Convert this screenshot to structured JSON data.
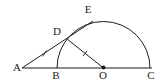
{
  "diagram": {
    "canvas": {
      "width": 164,
      "height": 82,
      "background": "#ffffff",
      "stroke_color": "#1c1c1c",
      "stroke_width": 1
    },
    "circle": {
      "name": "semicircle-arc",
      "cx": 103.5,
      "cy": 68,
      "r": 46.5
    },
    "segments": [
      {
        "name": "baseline-AC",
        "x1": 22,
        "y1": 68,
        "x2": 152,
        "y2": 68
      },
      {
        "name": "secant-ADE",
        "x1": 22,
        "y1": 68,
        "x2": 93,
        "y2": 21
      },
      {
        "name": "segment-DO",
        "x1": 67,
        "y1": 39,
        "x2": 103.5,
        "y2": 68
      }
    ],
    "ticks": [
      {
        "name": "tick-AD",
        "x": 44.5,
        "y": 53.5,
        "angle_deg": 57,
        "len": 7
      },
      {
        "name": "tick-DO",
        "x": 85.0,
        "y": 53.5,
        "angle_deg": 51,
        "len": 7
      }
    ],
    "center_dot": {
      "name": "center-dot-O",
      "x": 103.5,
      "y": 67.5,
      "r": 1.9,
      "fill": "#111111"
    },
    "labels": [
      {
        "name": "label-A",
        "text": "A",
        "x": 17,
        "y": 71,
        "size": 11
      },
      {
        "name": "label-B",
        "text": "B",
        "x": 56,
        "y": 79,
        "size": 11
      },
      {
        "name": "label-O",
        "text": "O",
        "x": 103,
        "y": 79,
        "size": 11
      },
      {
        "name": "label-C",
        "text": "C",
        "x": 151,
        "y": 79,
        "size": 11
      },
      {
        "name": "label-D",
        "text": "D",
        "x": 57,
        "y": 35,
        "size": 11
      },
      {
        "name": "label-E",
        "text": "E",
        "x": 88,
        "y": 13,
        "size": 11
      }
    ]
  }
}
